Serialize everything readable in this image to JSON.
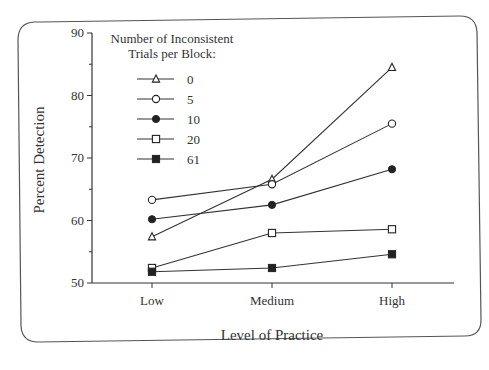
{
  "chart_data": {
    "type": "line",
    "title": "",
    "xlabel": "Level of Practice",
    "ylabel": "Percent Detection",
    "categories": [
      "Low",
      "Medium",
      "High"
    ],
    "ylim": [
      50,
      90
    ],
    "yticks": [
      50,
      60,
      70,
      80,
      90
    ],
    "grid": false,
    "legend_title": "Number of Inconsistent Trials per Block:",
    "legend_title_lines": [
      "Number of Inconsistent",
      "Trials per Block:"
    ],
    "legend_position": "upper-left",
    "series": [
      {
        "name": "0",
        "marker": "open-triangle",
        "values": [
          57.4,
          66.6,
          84.5
        ]
      },
      {
        "name": "5",
        "marker": "open-circle",
        "values": [
          63.3,
          65.8,
          75.5
        ]
      },
      {
        "name": "10",
        "marker": "filled-circle",
        "values": [
          60.2,
          62.5,
          68.2
        ]
      },
      {
        "name": "20",
        "marker": "open-square",
        "values": [
          52.4,
          58.0,
          58.6
        ]
      },
      {
        "name": "61",
        "marker": "filled-square",
        "values": [
          51.8,
          52.4,
          54.6
        ]
      }
    ]
  }
}
